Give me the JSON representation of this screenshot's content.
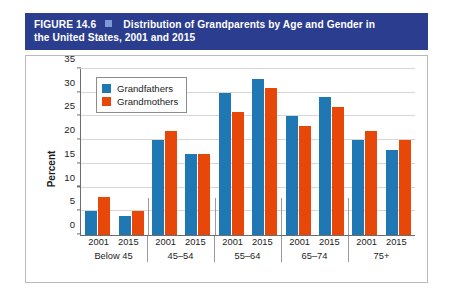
{
  "caption": {
    "figure_number": "FIGURE 14.6",
    "marker_icon": "square-marker",
    "title_line_1": "Distribution of Grandparents by Age and Gender in",
    "title_line_2": "the United States, 2001 and 2015"
  },
  "colors": {
    "banner": "#2a3d8f",
    "grandfathers": "#1f77b4",
    "grandmothers": "#e8470a",
    "grid": "#d6d6d6",
    "axis": "#6d6d6d"
  },
  "chart_data": {
    "type": "bar",
    "title": "Distribution of Grandparents by Age and Gender in the United States, 2001 and 2015",
    "xlabel": "",
    "ylabel": "Percent",
    "ylim": [
      0,
      35
    ],
    "yticks": [
      0,
      5,
      10,
      15,
      20,
      25,
      30,
      35
    ],
    "ytick_labels": [
      "0",
      "5",
      "10",
      "15",
      "20",
      "25",
      "30",
      "35"
    ],
    "grid": true,
    "legend_position": "upper left",
    "categories": [
      "Below 45",
      "45–54",
      "55–64",
      "65–74",
      "75+"
    ],
    "subcategories": [
      "2001",
      "2015"
    ],
    "series": [
      {
        "name": "Grandfathers",
        "color": "#1f77b4",
        "values_by_group": [
          {
            "group": "Below 45",
            "2001": 5,
            "2015": 4
          },
          {
            "group": "45–54",
            "2001": 20,
            "2015": 17
          },
          {
            "group": "55–64",
            "2001": 30,
            "2015": 33
          },
          {
            "group": "65–74",
            "2001": 25,
            "2015": 29
          },
          {
            "group": "75+",
            "2001": 20,
            "2015": 18
          }
        ]
      },
      {
        "name": "Grandmothers",
        "color": "#e8470a",
        "values_by_group": [
          {
            "group": "Below 45",
            "2001": 8,
            "2015": 5
          },
          {
            "group": "45–54",
            "2001": 22,
            "2015": 17
          },
          {
            "group": "55–64",
            "2001": 26,
            "2015": 31
          },
          {
            "group": "65–74",
            "2001": 23,
            "2015": 27
          },
          {
            "group": "75+",
            "2001": 22,
            "2015": 20
          }
        ]
      }
    ],
    "legend": [
      {
        "label": "Grandfathers",
        "color": "#1f77b4"
      },
      {
        "label": "Grandmothers",
        "color": "#e8470a"
      }
    ]
  }
}
